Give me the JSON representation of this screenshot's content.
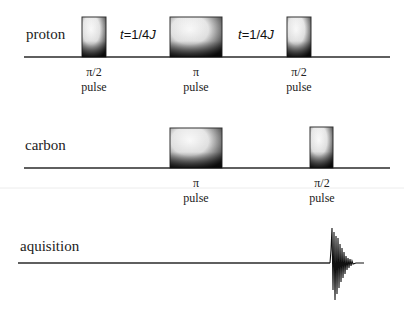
{
  "diagram": {
    "type": "pulse-sequence",
    "channels": [
      {
        "name": "proton",
        "label": "proton",
        "pulses": [
          {
            "flip": "π/2",
            "label_top": "π/2",
            "label_bottom": "pulse"
          },
          {
            "flip": "π",
            "label_top": "π",
            "label_bottom": "pulse"
          },
          {
            "flip": "π/2",
            "label_top": "π/2",
            "label_bottom": "pulse"
          }
        ],
        "delays": [
          {
            "var": "t",
            "value": "=1/4",
            "unit": "J"
          },
          {
            "var": "t",
            "value": "=1/4",
            "unit": "J"
          }
        ]
      },
      {
        "name": "carbon",
        "label": "carbon",
        "pulses": [
          {
            "flip": "π",
            "label_top": "π",
            "label_bottom": "pulse"
          },
          {
            "flip": "π/2",
            "label_top": "π/2",
            "label_bottom": "pulse"
          }
        ]
      },
      {
        "name": "aquisition",
        "label": "aquisition",
        "signal": "FID"
      }
    ],
    "colors": {
      "line": "#222222",
      "pulse_dark": "#1a1a1a",
      "pulse_light": "#ffffff",
      "separator": "#e6e6e6"
    }
  }
}
